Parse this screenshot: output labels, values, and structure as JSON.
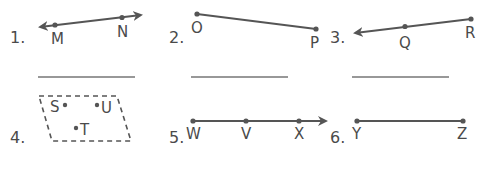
{
  "worksheet": {
    "colors": {
      "ink": "#555555",
      "text": "#4a4a4a",
      "answer_line": "#333333",
      "background": "#ffffff"
    },
    "problems": [
      {
        "number": "1.",
        "figure": "line",
        "points": [
          "M",
          "N"
        ],
        "arrows": "both",
        "answer_blank": true
      },
      {
        "number": "2.",
        "figure": "segment",
        "points": [
          "O",
          "P"
        ],
        "arrows": "none",
        "answer_blank": true
      },
      {
        "number": "3.",
        "figure": "ray",
        "points": [
          "Q",
          "R"
        ],
        "arrows": "left",
        "answer_blank": true
      },
      {
        "number": "4.",
        "figure": "plane",
        "points": [
          "S",
          "U",
          "T"
        ],
        "arrows": "none",
        "answer_blank": false
      },
      {
        "number": "5.",
        "figure": "ray",
        "points": [
          "W",
          "V",
          "X"
        ],
        "arrows": "right",
        "answer_blank": false
      },
      {
        "number": "6.",
        "figure": "segment",
        "points": [
          "Y",
          "Z"
        ],
        "arrows": "none",
        "answer_blank": false
      }
    ]
  }
}
